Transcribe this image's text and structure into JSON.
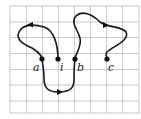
{
  "diagram": {
    "grid": {
      "columns": 8,
      "rows": 7
    },
    "points": [
      {
        "id": "a",
        "label": "a"
      },
      {
        "id": "i",
        "label": "i"
      },
      {
        "id": "b",
        "label": "b"
      },
      {
        "id": "c",
        "label": "c"
      }
    ],
    "colors": {
      "grid": "#c8c8c8",
      "curve": "#1a1a1a"
    }
  }
}
